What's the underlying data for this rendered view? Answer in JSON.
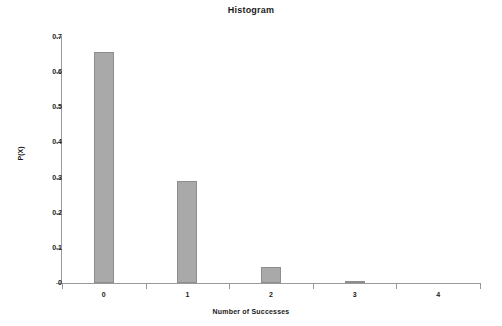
{
  "chart_data": {
    "type": "bar",
    "title": "Histogram",
    "xlabel": "Number of Successes",
    "ylabel": "P(X)",
    "categories": [
      "0",
      "1",
      "2",
      "3",
      "4"
    ],
    "values": [
      0.656,
      0.29,
      0.046,
      0.003,
      0.0
    ],
    "ylim": [
      0,
      0.7
    ],
    "ytick_labels": [
      "0.7",
      "0.6",
      "0.5",
      "0.4",
      "0.3",
      "0.2",
      "0.1",
      "0"
    ],
    "ytick_values": [
      0.7,
      0.6,
      0.5,
      0.4,
      0.3,
      0.2,
      0.1,
      0
    ],
    "xtick_labels": [
      "0",
      "1",
      "2",
      "3",
      "4"
    ],
    "grid": false,
    "legend": false,
    "bar_color": "#a9a9a9",
    "bar_edge_color": "#8d8d8d",
    "axis_color": "#9a9a9a",
    "text_color": "#1a1a1a",
    "background": "#ffffff"
  }
}
